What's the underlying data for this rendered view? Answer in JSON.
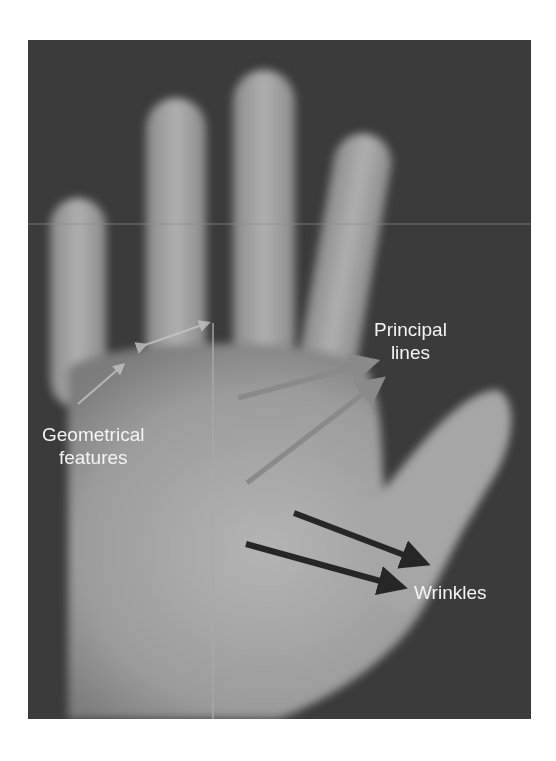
{
  "figure": {
    "background_color": "#3b3b3b",
    "labels": {
      "principal_lines": [
        "Principal",
        "lines"
      ],
      "geometrical_features": [
        "Geometrical",
        "features"
      ],
      "wrinkles": "Wrinkles"
    },
    "annotation_colors": {
      "principal_lines_arrows": "#8a8a8a",
      "wrinkle_arrows": "#262626",
      "geometric_lines": "#c4c4c4"
    }
  }
}
